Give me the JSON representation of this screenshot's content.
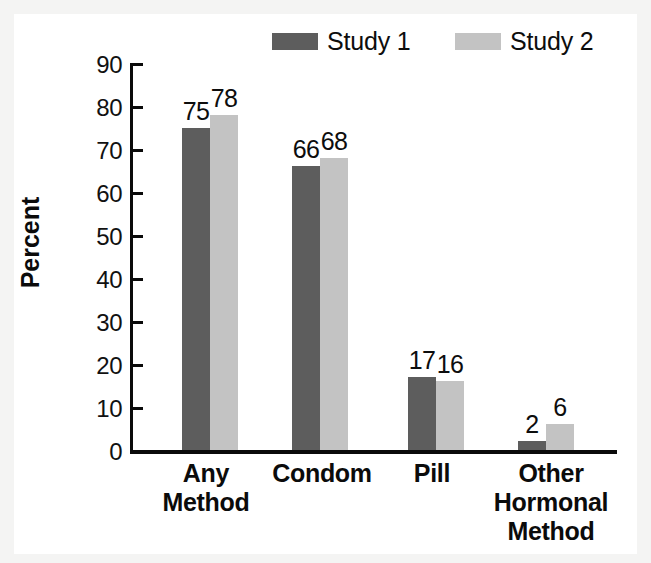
{
  "chart_data": {
    "type": "bar",
    "title": "",
    "xlabel": "",
    "ylabel": "Percent",
    "ylim": [
      0,
      90
    ],
    "ytick_step": 10,
    "yticks": [
      "90",
      "80",
      "70",
      "60",
      "50",
      "40",
      "30",
      "20",
      "10",
      "0"
    ],
    "grid": false,
    "legend_position": "top-center",
    "categories": [
      "Any Method",
      "Condom",
      "Pill",
      "Other Hormonal Method"
    ],
    "category_lines": [
      [
        "Any",
        "Method"
      ],
      [
        "Condom"
      ],
      [
        "Pill"
      ],
      [
        "Other",
        "Hormonal",
        "Method"
      ]
    ],
    "series": [
      {
        "name": "Study 1",
        "color": "#5d5d5d",
        "values": [
          75,
          66,
          17,
          2
        ]
      },
      {
        "name": "Study 2",
        "color": "#c3c3c3",
        "values": [
          78,
          68,
          16,
          6
        ]
      }
    ],
    "data_labels": [
      [
        "75",
        "78"
      ],
      [
        "66",
        "68"
      ],
      [
        "17",
        "16"
      ],
      [
        "2",
        "6"
      ]
    ]
  },
  "legend": {
    "entries": [
      {
        "label": "Study 1",
        "swatch": "dark-gray-swatch"
      },
      {
        "label": "Study 2",
        "swatch": "light-gray-swatch"
      }
    ]
  },
  "axes": {
    "y_label": "Percent",
    "y_ticks": [
      "90",
      "80",
      "70",
      "60",
      "50",
      "40",
      "30",
      "20",
      "10",
      "0"
    ]
  },
  "colors": {
    "series_1": "#5d5d5d",
    "series_2": "#c3c3c3",
    "axis": "#0a0a0a",
    "text": "#0d0d0d",
    "plot_background": "#ffffff",
    "figure_background": "#f4f4f3"
  }
}
